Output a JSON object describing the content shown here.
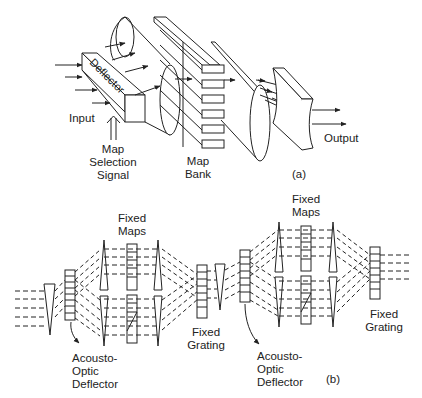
{
  "diagram_a": {
    "tag": "(a)",
    "labels": {
      "deflector": "Deflector",
      "input": "Input",
      "map_selection_signal": [
        "Map",
        "Selection",
        "Signal"
      ],
      "map_bank": [
        "Map",
        "Bank"
      ],
      "output": "Output"
    }
  },
  "diagram_b": {
    "tag": "(b)",
    "labels": {
      "fixed_maps_1": [
        "Fixed",
        "Maps"
      ],
      "fixed_maps_2": [
        "Fixed",
        "Maps"
      ],
      "fixed_grating_1": [
        "Fixed",
        "Grating"
      ],
      "fixed_grating_2": [
        "Fixed",
        "Grating"
      ],
      "ao_deflector_1": [
        "Acousto-",
        "Optic",
        "Deflector"
      ],
      "ao_deflector_2": [
        "Acousto-",
        "Optic",
        "Deflector"
      ]
    }
  },
  "colors": {
    "line": "#222222",
    "background": "#ffffff"
  }
}
